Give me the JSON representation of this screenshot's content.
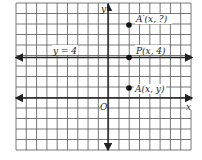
{
  "diagram": {
    "type": "coordinate-grid",
    "axes": {
      "x_label": "x",
      "y_label": "y",
      "origin_label": "O"
    },
    "horizontal_line": {
      "label": "y = 4",
      "y": 4
    },
    "points": [
      {
        "id": "A-prime",
        "label": "A′(x, ?)",
        "x": 2,
        "y": 7
      },
      {
        "id": "P",
        "label": "P(x, 4)",
        "x": 2,
        "y": 4
      },
      {
        "id": "A",
        "label": "A(x, y)",
        "x": 2,
        "y": 1
      }
    ],
    "colors": {
      "grid": "#444444",
      "axis": "#222222",
      "background": "#ffffff"
    }
  }
}
